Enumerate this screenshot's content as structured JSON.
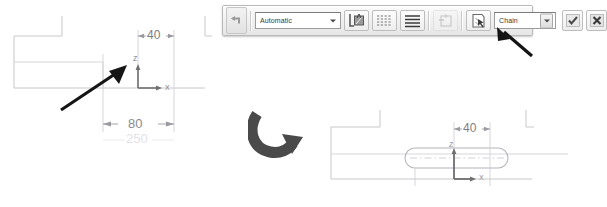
{
  "app": {
    "background_color": "#ffffff",
    "type": "cad-sketch-editor"
  },
  "toolbar": {
    "name": "command-options-toolbar",
    "grip_icon": "undo-arrow-icon",
    "material_combo": {
      "value": "Automatic",
      "placeholder": "Automatic",
      "dropdown_icon": "chevron-down-icon"
    },
    "buttons": [
      {
        "name": "hatch-boundary-button",
        "icon": "hatch-boundary-icon",
        "enabled": true
      },
      {
        "name": "hatch-pattern-dashed-button",
        "icon": "dashed-lines-icon",
        "enabled": true
      },
      {
        "name": "hatch-pattern-solid-button",
        "icon": "solid-lines-icon",
        "enabled": true
      },
      {
        "name": "remove-boundary-button",
        "icon": "remove-boundary-icon",
        "enabled": false
      },
      {
        "name": "select-boundary-button",
        "icon": "pick-points-icon",
        "enabled": true
      }
    ],
    "pattern_combo": {
      "value": "Chain",
      "placeholder": "Chain",
      "dropdown_icon": "chevron-down-icon"
    },
    "accept_button": {
      "name": "accept-button",
      "label": "",
      "icon": "checkmark-icon"
    },
    "cancel_button": {
      "name": "cancel-button",
      "label": "",
      "icon": "close-x-icon"
    }
  },
  "annotations": {
    "toolbar_pointer": {
      "name": "pointer-arrow-to-accept-button",
      "icon": "arrow-up-left-icon",
      "color": "#1a1a1a"
    },
    "sketch_pointer": {
      "name": "pointer-arrow-to-origin",
      "icon": "arrow-up-right-icon",
      "color": "#1a1a1a"
    },
    "transition_arrow": {
      "name": "result-curved-arrow",
      "icon": "curved-arrow-right-icon",
      "color": "#4a4a4a"
    }
  },
  "drawing_before": {
    "name": "sketch-before",
    "dimensions": [
      {
        "name": "dimension-40",
        "value": "40",
        "orientation": "horizontal"
      },
      {
        "name": "dimension-80",
        "value": "80",
        "orientation": "horizontal"
      },
      {
        "name": "dimension-250",
        "value": "250",
        "orientation": "horizontal",
        "faded": true
      }
    ],
    "axes": [
      {
        "name": "axis-label-z",
        "label": "Z"
      },
      {
        "name": "axis-label-x",
        "label": "X"
      }
    ],
    "line_color": "#b9b9bf",
    "axis_color": "#8a8a8a"
  },
  "drawing_after": {
    "name": "sketch-after",
    "dimensions": [
      {
        "name": "dimension-40",
        "value": "40",
        "orientation": "horizontal"
      }
    ],
    "axes": [
      {
        "name": "axis-label-z",
        "label": "Z"
      },
      {
        "name": "axis-label-x",
        "label": "X"
      }
    ],
    "shape": {
      "name": "slot-profile",
      "type": "obround"
    },
    "line_color": "#b9b9bf",
    "axis_color": "#8a8a8a"
  }
}
